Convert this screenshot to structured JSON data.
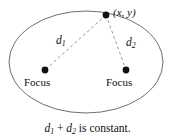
{
  "figure": {
    "background_color": "#ffffff",
    "width": 175,
    "height": 139
  },
  "ellipse": {
    "stroke_color": "#6f6f6f",
    "stroke_width": 1,
    "center_x": 86,
    "center_y": 62,
    "radius_x": 77,
    "radius_y": 51
  },
  "points": {
    "vertex_point": {
      "label_prefix": "(",
      "label_x": "x",
      "label_sep": ", ",
      "label_y": "y",
      "label_suffix": ")",
      "label_full": "(x, y)",
      "cx": 106,
      "cy": 15,
      "r": 3.4,
      "color": "#111111"
    },
    "focus_left": {
      "label": "Focus",
      "cx": 45,
      "cy": 70,
      "r": 3.4,
      "color": "#111111"
    },
    "focus_right": {
      "label": "Focus",
      "cx": 126,
      "cy": 70,
      "r": 3.4,
      "color": "#111111"
    }
  },
  "segments": {
    "d1": {
      "base_label": "d",
      "subscript": "1",
      "label_full": "d₁",
      "x1": 106,
      "y1": 15,
      "x2": 45,
      "y2": 70,
      "stroke_color": "#9a9a9a",
      "dash": "3,2.6"
    },
    "d2": {
      "base_label": "d",
      "subscript": "2",
      "label_full": "d₂",
      "x1": 106,
      "y1": 15,
      "x2": 126,
      "y2": 70,
      "stroke_color": "#9a9a9a",
      "dash": "3,2.6"
    }
  },
  "caption": {
    "term1_base": "d",
    "term1_sub": "1",
    "plus": " + ",
    "term2_base": "d",
    "term2_sub": "2",
    "tail": " is constant.",
    "full_text": "d₁ + d₂ is constant."
  }
}
